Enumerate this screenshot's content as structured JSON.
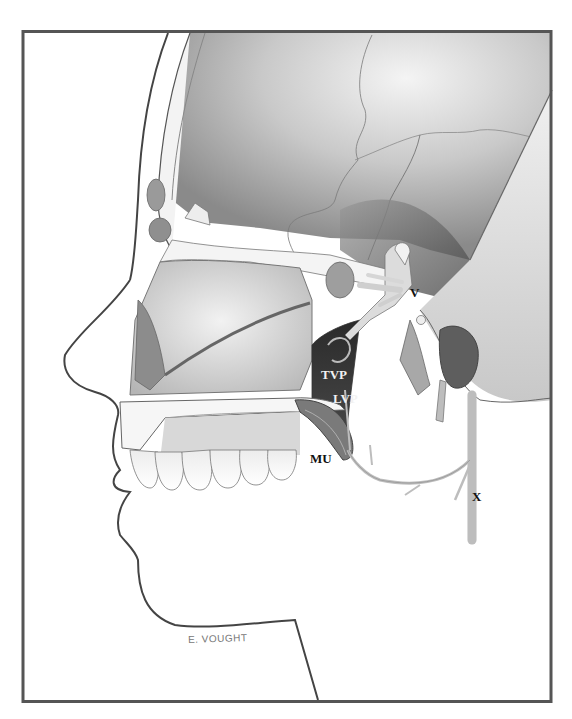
{
  "figure": {
    "frame_color": "#555555",
    "labels": {
      "v": "V",
      "tvp": "TVP",
      "lvp": "LVP",
      "mu": "MU",
      "x": "X"
    },
    "signature": "E. VOUGHT"
  }
}
